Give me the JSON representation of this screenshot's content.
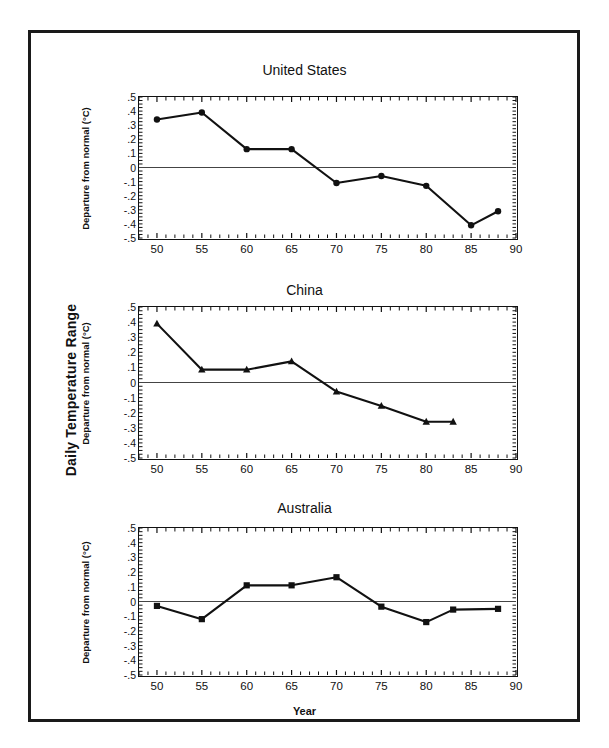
{
  "figure": {
    "outer_axis_label": "Daily Temperature Range",
    "xlabel": "Year",
    "ylabel": "Departure from normal (°C)",
    "accent": "#111111",
    "frame_color": "#1a1a1a"
  },
  "axis": {
    "yticks": [
      ".5",
      ".4",
      ".3",
      ".2",
      ".1",
      "0",
      "-.1",
      "-.2",
      "-.3",
      "-.4",
      "-.5"
    ],
    "ytick_values": [
      0.5,
      0.4,
      0.3,
      0.2,
      0.1,
      0,
      -0.1,
      -0.2,
      -0.3,
      -0.4,
      -0.5
    ],
    "xticks": [
      "50",
      "55",
      "60",
      "65",
      "70",
      "75",
      "80",
      "85",
      "90"
    ],
    "xtick_values": [
      50,
      55,
      60,
      65,
      70,
      75,
      80,
      85,
      90
    ]
  },
  "chart_data": [
    {
      "type": "line",
      "title": "United States",
      "xlabel": "",
      "ylabel": "Departure from normal (°C)",
      "xlim": [
        48,
        90
      ],
      "ylim": [
        -0.5,
        0.5
      ],
      "grid": false,
      "legend": "none",
      "marker": "circle",
      "zero_line": true,
      "x": [
        50,
        55,
        60,
        65,
        70,
        75,
        80,
        85,
        88
      ],
      "values": [
        0.34,
        0.39,
        0.13,
        0.13,
        -0.11,
        -0.06,
        -0.13,
        -0.41,
        -0.31
      ]
    },
    {
      "type": "line",
      "title": "China",
      "xlabel": "",
      "ylabel": "Departure from normal (°C)",
      "xlim": [
        48,
        90
      ],
      "ylim": [
        -0.5,
        0.5
      ],
      "grid": false,
      "legend": "none",
      "marker": "triangle",
      "zero_line": true,
      "x": [
        50,
        55,
        60,
        65,
        70,
        75,
        80,
        83
      ],
      "values": [
        0.39,
        0.085,
        0.085,
        0.14,
        -0.06,
        -0.155,
        -0.26,
        -0.26
      ]
    },
    {
      "type": "line",
      "title": "Australia",
      "xlabel": "Year",
      "ylabel": "Departure from normal (°C)",
      "xlim": [
        48,
        90
      ],
      "ylim": [
        -0.5,
        0.5
      ],
      "grid": false,
      "legend": "none",
      "marker": "square",
      "zero_line": true,
      "x": [
        50,
        55,
        60,
        65,
        70,
        75,
        80,
        83,
        88
      ],
      "values": [
        -0.03,
        -0.12,
        0.11,
        0.11,
        0.165,
        -0.035,
        -0.14,
        -0.055,
        -0.05
      ]
    }
  ]
}
